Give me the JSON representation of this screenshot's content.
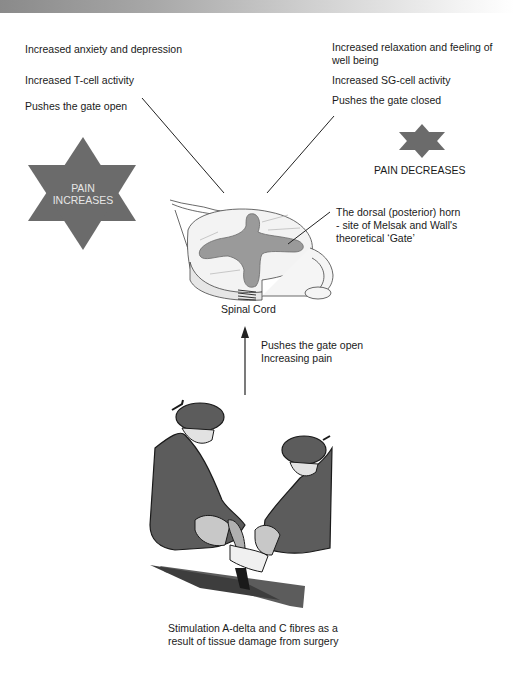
{
  "header": {
    "band": "gradient-bar"
  },
  "left_effects": {
    "items": [
      "Increased anxiety and depression",
      "Increased T-cell activity",
      "Pushes the gate open"
    ]
  },
  "right_effects": {
    "items": [
      "Increased relaxation and feeling of well being",
      "Increased SG-cell activity",
      "Pushes the gate closed"
    ]
  },
  "pain_increases": {
    "line1": "PAIN",
    "line2": "INCREASES",
    "icon": "star-icon"
  },
  "pain_decreases": {
    "label": "PAIN DECREASES",
    "icon": "star-icon"
  },
  "spinal_cord": {
    "label": "Spinal Cord",
    "annotation": "The dorsal (posterior) horn - site of Melsak and Wall's theoretical ‘Gate’"
  },
  "arrow": {
    "line1": "Pushes the gate open",
    "line2": "Increasing pain",
    "icon": "arrow-up-icon"
  },
  "surgery": {
    "caption": "Stimulation A-delta and C fibres as a result of tissue damage from surgery",
    "illustration": "surgeons-operating"
  },
  "colors": {
    "star": "#6b6b6b",
    "gray_matter": "#9a9a9a",
    "scrubs": "#5c5c5c",
    "scrubs_dark": "#3d3d3d",
    "light": "#d2d2d2",
    "text": "#1a1a1a"
  }
}
